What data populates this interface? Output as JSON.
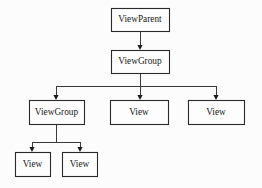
{
  "diagram": {
    "type": "tree",
    "background_color": "#fcfcfc",
    "box_fill_color": "#fdfdfd",
    "box_border_color": "#2a2a2a",
    "edge_color": "#3a3a3a",
    "text_color": "#1a1a1a",
    "nodes": [
      {
        "id": "view-parent",
        "label": "ViewParent",
        "level": 0,
        "x": 111,
        "y": 8,
        "width": 58,
        "height": 23
      },
      {
        "id": "view-group-root",
        "label": "ViewGroup",
        "level": 1,
        "x": 111,
        "y": 50,
        "width": 58,
        "height": 23
      },
      {
        "id": "view-group-child",
        "label": "ViewGroup",
        "level": 2,
        "x": 29,
        "y": 100,
        "width": 55,
        "height": 24
      },
      {
        "id": "view-mid",
        "label": "View",
        "level": 2,
        "x": 110,
        "y": 100,
        "width": 58,
        "height": 24
      },
      {
        "id": "view-right",
        "label": "View",
        "level": 2,
        "x": 188,
        "y": 100,
        "width": 56,
        "height": 24
      },
      {
        "id": "view-leaf-left",
        "label": "View",
        "level": 3,
        "x": 15,
        "y": 152,
        "width": 35,
        "height": 24
      },
      {
        "id": "view-leaf-right",
        "label": "View",
        "level": 3,
        "x": 62,
        "y": 152,
        "width": 35,
        "height": 24
      }
    ],
    "edges": [
      {
        "id": "edge-parent-to-group",
        "from": "view-parent",
        "to": "view-group-root",
        "kind": "straight",
        "path": "M 140 31 L 140 47",
        "arrow_x": 140,
        "arrow_y": 50
      },
      {
        "id": "edge-group-to-viewgroup",
        "from": "view-group-root",
        "to": "view-group-child",
        "kind": "elbow",
        "path": "M 140 73 L 140 86 L 56 86 L 56 97",
        "arrow_x": 56,
        "arrow_y": 100
      },
      {
        "id": "edge-group-to-view-mid",
        "from": "view-group-root",
        "to": "view-mid",
        "kind": "straight",
        "path": "M 140 73 L 140 97",
        "arrow_x": 140,
        "arrow_y": 100
      },
      {
        "id": "edge-group-to-view-right",
        "from": "view-group-root",
        "to": "view-right",
        "kind": "elbow",
        "path": "M 140 86 L 216 86 L 216 97",
        "arrow_x": 216,
        "arrow_y": 100
      },
      {
        "id": "edge-viewgroup-to-leaf-left",
        "from": "view-group-child",
        "to": "view-leaf-left",
        "kind": "elbow",
        "path": "M 56 124 L 56 142 L 32 142 L 32 149",
        "arrow_x": 32,
        "arrow_y": 152
      },
      {
        "id": "edge-viewgroup-to-leaf-right",
        "from": "view-group-child",
        "to": "view-leaf-right",
        "kind": "elbow",
        "path": "M 56 142 L 80 142 L 80 149",
        "arrow_x": 80,
        "arrow_y": 152
      }
    ]
  }
}
